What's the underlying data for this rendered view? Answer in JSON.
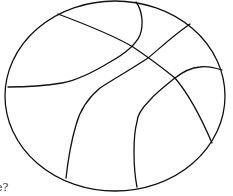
{
  "figure": {
    "stroke_color": "#111111",
    "background_color": "#ffffff",
    "outline": {
      "cx": 115,
      "cy": 96,
      "rx": 110,
      "ry": 95
    },
    "seams": [
      {
        "name": "seam-diagonal-top-left-to-bottom-right",
        "points": "M58,14 C90,26 118,38 133,47 C145,55 160,66 175,78 C192,98 203,122 212,143"
      },
      {
        "name": "seam-top-curve-to-left",
        "points": "M136,2 C142,10 144,24 140,35 C137,42 128,52 110,62 C92,73 78,80 62,83 C44,86 25,87 8,87"
      },
      {
        "name": "seam-upper-right-to-bottom",
        "points": "M190,24 C170,38 158,50 148,58 C130,70 112,80 100,88 C88,98 80,110 76,125 C71,142 68,160 66,178"
      },
      {
        "name": "seam-right-curve-to-bottom",
        "points": "M222,70 C212,67 205,66 200,67 C188,68 180,74 175,78 C165,86 156,93 150,100 C142,108 137,116 137,122 C134,132 134,142 134,152 C134,165 135,177 137,187"
      }
    ]
  },
  "caption": {
    "text": "e?"
  }
}
